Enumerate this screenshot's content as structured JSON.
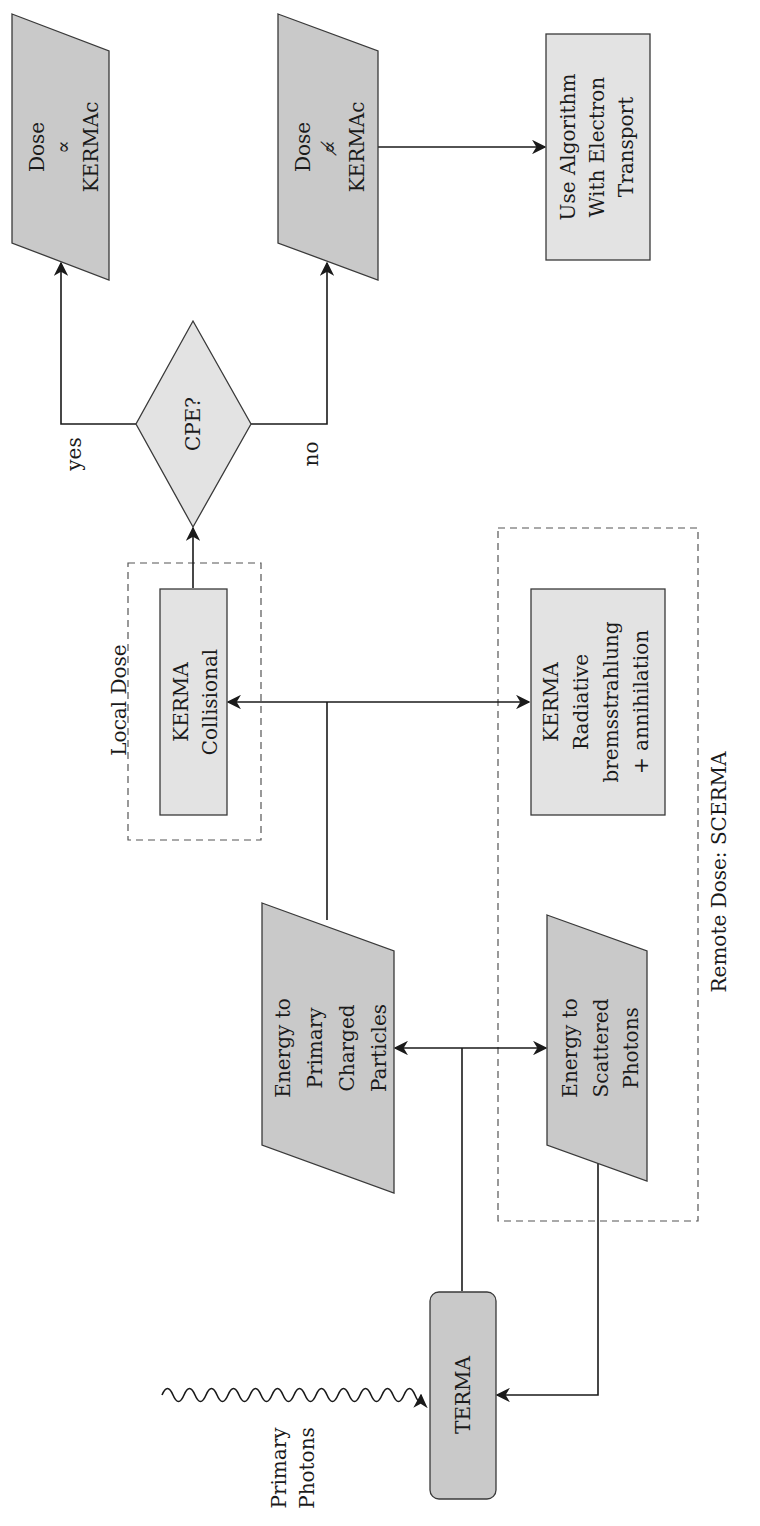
{
  "diagram": {
    "nodes": {
      "dose_prop": {
        "lines": [
          "Dose",
          "∝",
          "KERMAc"
        ],
        "shape": "parallelogram"
      },
      "dose_notprop": {
        "lines": [
          "Dose",
          "∝̸",
          "KERMAc"
        ],
        "shape": "parallelogram"
      },
      "electron_transport": {
        "lines": [
          "Use Algorithm",
          "With Electron",
          "Transport"
        ],
        "shape": "rectangle"
      },
      "cpe": {
        "lines": [
          "CPE?"
        ],
        "shape": "diamond"
      },
      "kerma_collisional": {
        "lines": [
          "KERMA",
          "Collisional"
        ],
        "shape": "rectangle"
      },
      "kerma_radiative": {
        "lines": [
          "KERMA",
          "Radiative",
          "bremsstrahlung",
          "+ annihilation"
        ],
        "shape": "rectangle"
      },
      "energy_primary": {
        "lines": [
          "Energy to",
          "Primary",
          "Charged",
          "Particles"
        ],
        "shape": "parallelogram"
      },
      "energy_scattered": {
        "lines": [
          "Energy to",
          "Scattered",
          "Photons"
        ],
        "shape": "parallelogram"
      },
      "terma": {
        "lines": [
          "TERMA"
        ],
        "shape": "rounded-rectangle"
      }
    },
    "edge_labels": {
      "yes": "yes",
      "no": "no"
    },
    "groups": {
      "local_dose": "Local Dose",
      "remote_dose": "Remote Dose: SCERMA"
    },
    "input": {
      "lines": [
        "Primary",
        "Photons"
      ]
    },
    "colors": {
      "dark_fill": "#c9c9c9",
      "light_fill": "#e3e3e3",
      "stroke": "#3a3a3a",
      "dashed": "#555555"
    }
  }
}
